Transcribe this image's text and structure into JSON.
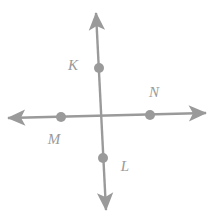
{
  "figure": {
    "type": "geometry-diagram",
    "background_color": "#ffffff",
    "stroke_color": "#9a9a9a",
    "stroke_width": 2.4,
    "point_radius": 5,
    "canvas": {
      "width": 216,
      "height": 216
    },
    "lines": [
      {
        "name": "vertical-line",
        "x1": 96,
        "y1": 13,
        "x2": 106,
        "y2": 210,
        "arrow_start": true,
        "arrow_end": true
      },
      {
        "name": "horizontal-line",
        "x1": 8,
        "y1": 118,
        "x2": 206,
        "y2": 113,
        "arrow_start": true,
        "arrow_end": true
      }
    ],
    "intersection": {
      "x": 101,
      "y": 115
    },
    "points": [
      {
        "id": "K",
        "label": "K",
        "cx": 99,
        "cy": 68,
        "label_x": 73,
        "label_y": 65
      },
      {
        "id": "M",
        "label": "M",
        "cx": 61,
        "cy": 117,
        "label_x": 54,
        "label_y": 139
      },
      {
        "id": "N",
        "label": "N",
        "cx": 150,
        "cy": 115,
        "label_x": 154,
        "label_y": 92
      },
      {
        "id": "L",
        "label": "L",
        "cx": 103,
        "cy": 158,
        "label_x": 125,
        "label_y": 166
      }
    ]
  }
}
